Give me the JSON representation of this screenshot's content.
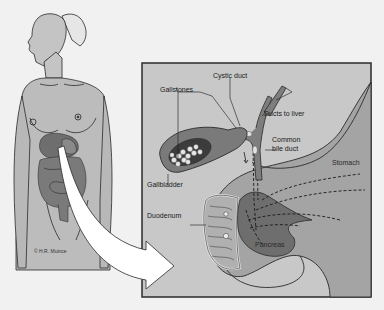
{
  "figure": {
    "credit": "© H.R. Muince",
    "colors": {
      "background": "#f1f1f1",
      "panel_fill": "#c8c8c8",
      "panel_border": "#2a2a2a",
      "skin": "#bcbcbc",
      "organ_dark": "#6e6e6e",
      "organ_mid": "#9a9a9a",
      "stomach": "#a8a8a8",
      "arrow": "#ffffff"
    }
  },
  "labels": {
    "gallstones": "Gallstones",
    "cystic_duct": "Cystic duct",
    "ducts_to_liver": "Ducts to liver",
    "common_bile_duct_line1": "Common",
    "common_bile_duct_line2": "bile duct",
    "stomach": "Stomach",
    "gallbladder": "Gallbladder",
    "duodenum": "Duodenum",
    "pancreas": "Pancreas"
  }
}
